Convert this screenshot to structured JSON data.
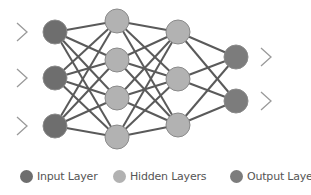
{
  "diagram": {
    "colors": {
      "input": "#6e6e6e",
      "hidden": "#b2b2b2",
      "output": "#7c7c7c",
      "edge": "#5a5a5a",
      "chevron": "#9a9a9a",
      "node_stroke": "#8a8a8a"
    },
    "node_radius": 12,
    "layers": [
      {
        "name": "input",
        "x": 55,
        "ys": [
          32,
          78,
          126
        ]
      },
      {
        "name": "hidden",
        "x": 117,
        "ys": [
          21,
          60,
          98,
          137
        ]
      },
      {
        "name": "hidden",
        "x": 178,
        "ys": [
          32,
          79,
          125
        ]
      },
      {
        "name": "output",
        "x": 236,
        "ys": [
          57,
          101
        ]
      }
    ],
    "input_chevrons": {
      "x": 22,
      "ys": [
        32,
        78,
        126
      ]
    },
    "output_chevrons": {
      "x": 261,
      "ys": [
        57,
        101
      ]
    }
  },
  "legend": {
    "items": [
      {
        "key": "input",
        "label": "Input Layer",
        "color": "#6e6e6e",
        "x": 20
      },
      {
        "key": "hidden",
        "label": "Hidden Layers",
        "color": "#b2b2b2",
        "x": 113
      },
      {
        "key": "output",
        "label": "Output Layer",
        "color": "#7c7c7c",
        "x": 230
      }
    ]
  }
}
